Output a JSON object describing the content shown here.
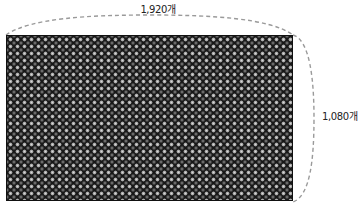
{
  "diagram": {
    "width_label": "1,920개",
    "height_label": "1,080개",
    "colors": {
      "panel_bg": "#161616",
      "dot_light": "#d8d8d8",
      "dot_mid": "#8c8c8c",
      "dashed_line": "#9a9a9a",
      "label_text": "#222222"
    }
  }
}
